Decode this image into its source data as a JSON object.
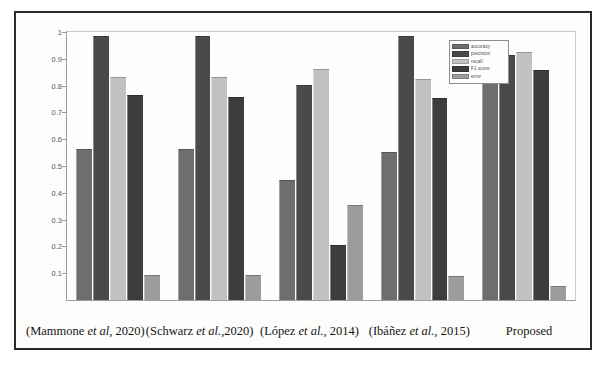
{
  "figure": {
    "border_color": "#2a2a2a",
    "background": "#fdfdfc"
  },
  "legend": {
    "position": "top-right-inside",
    "items": [
      {
        "label": "accuracy",
        "color": "#6e6e6e"
      },
      {
        "label": "precision",
        "color": "#4a4a4a"
      },
      {
        "label": "recall",
        "color": "#c2c2c2"
      },
      {
        "label": "F1 score",
        "color": "#3d3d3d"
      },
      {
        "label": "error",
        "color": "#9c9c9c"
      }
    ]
  },
  "yaxis": {
    "min": 0,
    "max": 1,
    "ticks": [
      "0.1",
      "0.2",
      "0.3",
      "0.4",
      "0.5",
      "0.6",
      "0.7",
      "0.8",
      "0.9",
      "1"
    ],
    "tick_values": [
      0.1,
      0.2,
      0.3,
      0.4,
      0.5,
      0.6,
      0.7,
      0.8,
      0.9,
      1
    ]
  },
  "xaxis": {
    "categories": [
      "(Mammone et al, 2020)",
      "(Schwarz et al.,2020)",
      "(López et al., 2014)",
      "(Ibáñez et al., 2015)",
      "Proposed"
    ]
  },
  "chart_data": {
    "type": "bar",
    "title": "",
    "xlabel": "",
    "ylabel": "",
    "ylim": [
      0,
      1
    ],
    "grid": false,
    "legend_position": "upper right",
    "categories": [
      "(Mammone et al, 2020)",
      "(Schwarz et al.,2020)",
      "(López et al., 2014)",
      "(Ibáñez et al., 2015)",
      "Proposed"
    ],
    "series": [
      {
        "name": "accuracy",
        "color": "#6e6e6e",
        "values": [
          0.56,
          0.56,
          0.445,
          0.55,
          0.95
        ]
      },
      {
        "name": "precision",
        "color": "#4a4a4a",
        "values": [
          0.98,
          0.98,
          0.8,
          0.98,
          0.91
        ]
      },
      {
        "name": "recall",
        "color": "#c2c2c2",
        "values": [
          0.83,
          0.83,
          0.86,
          0.82,
          0.92
        ]
      },
      {
        "name": "F1 score",
        "color": "#3d3d3d",
        "values": [
          0.76,
          0.755,
          0.2,
          0.75,
          0.855
        ]
      },
      {
        "name": "error",
        "color": "#9c9c9c",
        "values": [
          0.09,
          0.09,
          0.35,
          0.085,
          0.05
        ]
      }
    ]
  }
}
